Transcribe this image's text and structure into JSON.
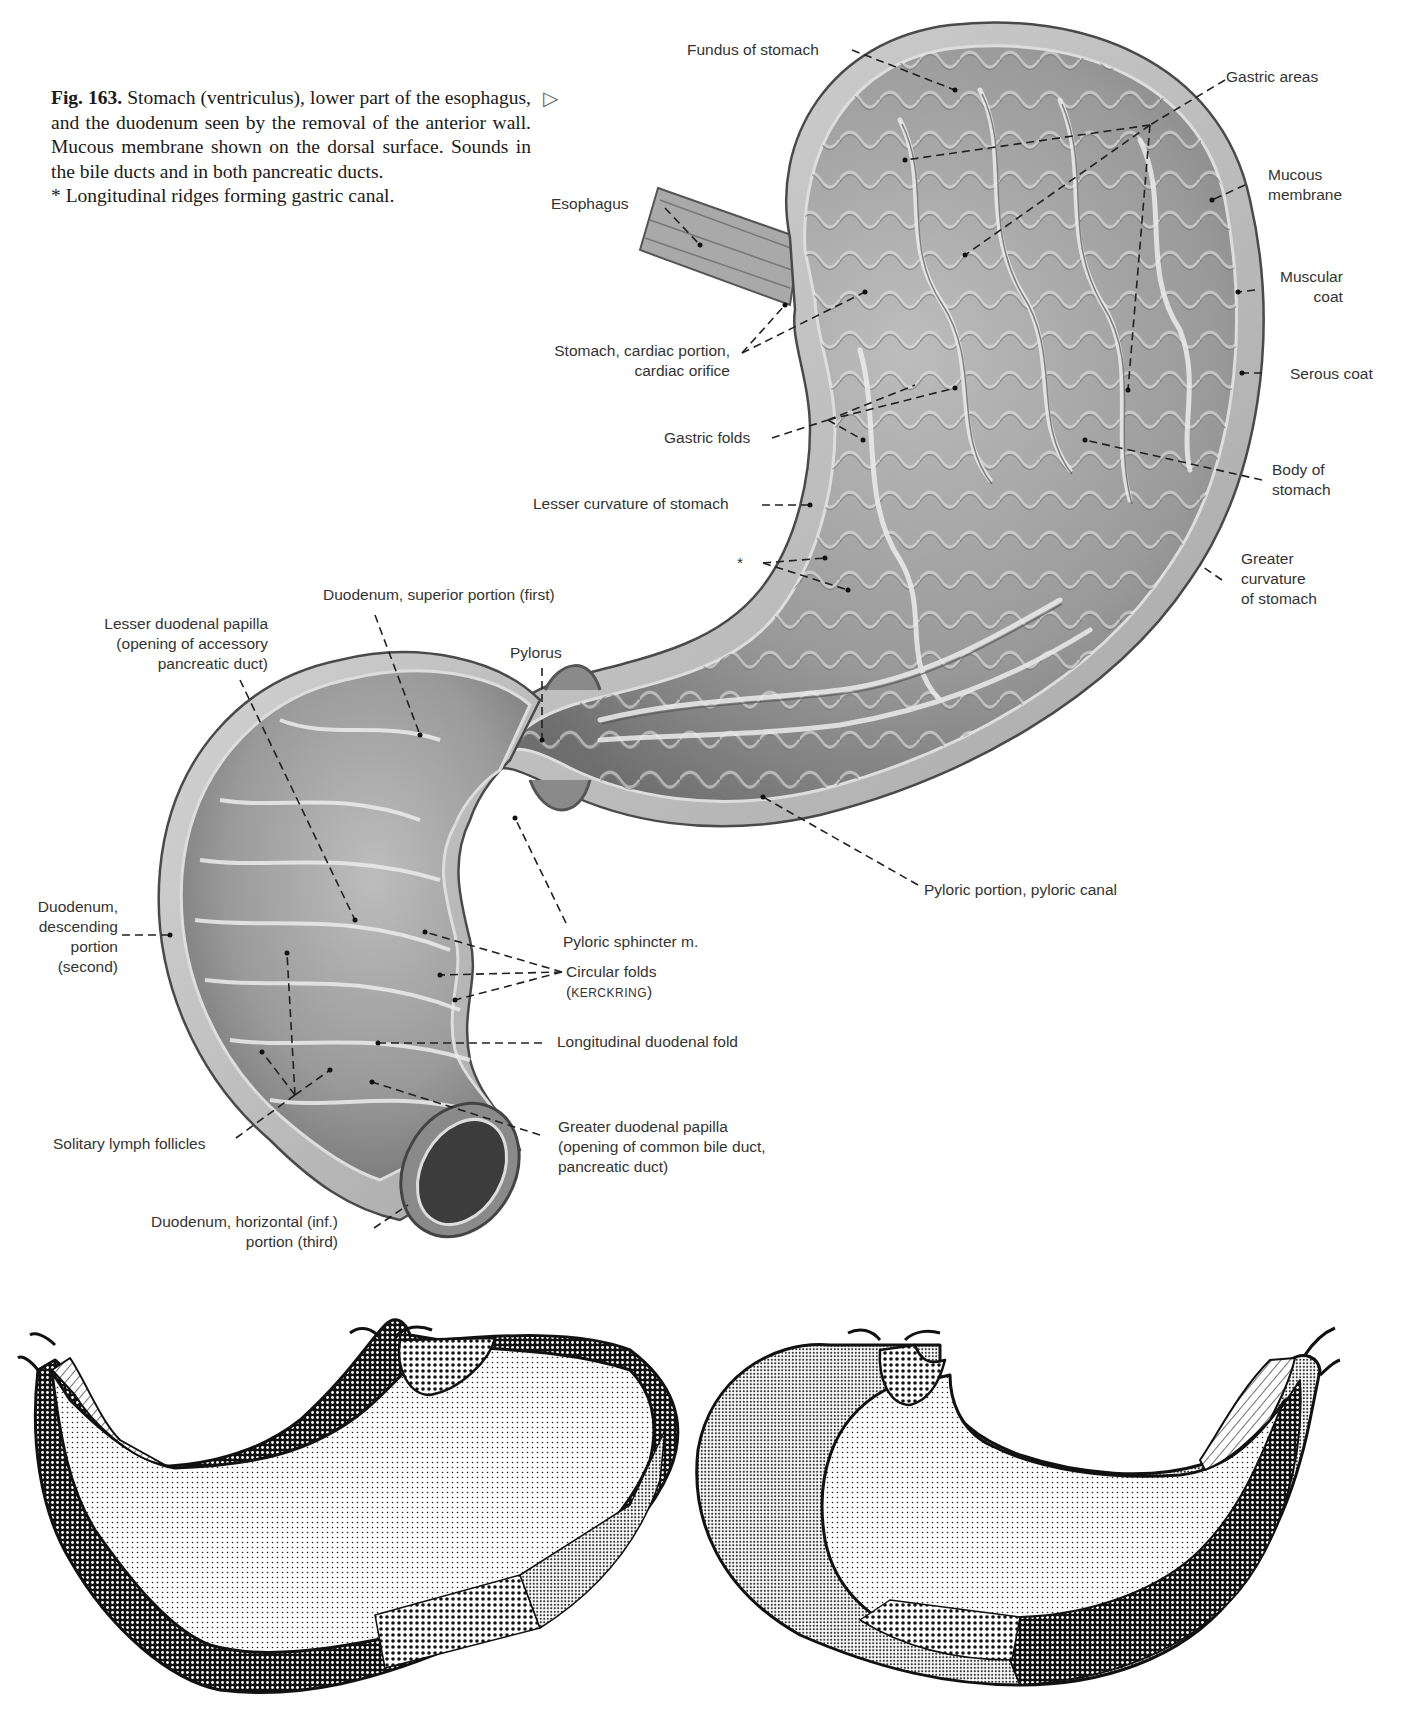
{
  "caption": {
    "figure_number": "Fig. 163.",
    "text": "Stomach (ventriculus), lower part of the esophagus, and the duodenum seen by the removal of the anterior wall. Mucous membrane shown on the dorsal surface. Sounds in the bile ducts and in both pancreatic ducts.",
    "footnote": "* Longitudinal ridges forming gastric canal.",
    "pointer_glyph": "▷"
  },
  "labels": {
    "fundus": "Fundus of stomach",
    "gastric_areas": "Gastric areas",
    "esophagus": "Esophagus",
    "mucous_membrane_1": "Mucous",
    "mucous_membrane_2": "membrane",
    "muscular_coat_1": "Muscular",
    "muscular_coat_2": "coat",
    "serous_coat": "Serous coat",
    "cardiac_1": "Stomach, cardiac portion,",
    "cardiac_2": "cardiac orifice",
    "gastric_folds": "Gastric folds",
    "body_1": "Body of",
    "body_2": "stomach",
    "lesser_curvature": "Lesser curvature of stomach",
    "asterisk": "*",
    "greater_curvature_1": "Greater",
    "greater_curvature_2": "curvature",
    "greater_curvature_3": "of stomach",
    "duodenum_superior": "Duodenum, superior portion (first)",
    "lesser_papilla_1": "Lesser duodenal papilla",
    "lesser_papilla_2": "(opening of accessory",
    "lesser_papilla_3": "pancreatic duct)",
    "pylorus": "Pylorus",
    "pyloric_portion": "Pyloric portion, pyloric canal",
    "duodenum_desc_1": "Duodenum,",
    "duodenum_desc_2": "descending",
    "duodenum_desc_3": "portion",
    "duodenum_desc_4": "(second)",
    "pyloric_sphincter": "Pyloric sphincter m.",
    "circular_folds_1": "Circular folds",
    "circular_folds_2a": "(",
    "circular_folds_2b": "Kerckring",
    "circular_folds_2c": ")",
    "longitudinal_fold": "Longitudinal duodenal fold",
    "solitary_follicles": "Solitary lymph follicles",
    "greater_papilla_1": "Greater duodenal papilla",
    "greater_papilla_2": "(opening of common bile duct,",
    "greater_papilla_3": "pancreatic duct)",
    "duodenum_horiz_1": "Duodenum, horizontal (inf.)",
    "duodenum_horiz_2": "portion (third)"
  },
  "schematics": {
    "left": {
      "regions": [
        "cardiac (hatched)",
        "fundus/body (fine dots)",
        "greater curvature band (coarse grid)",
        "pyloric band (medium grid)",
        "antrum band (fine grid)"
      ]
    },
    "right": {
      "regions": [
        "fundus (fine grid)",
        "cardia (coarse dots)",
        "body (fine dots)",
        "pyloric (hatched)",
        "greater curvature band (coarse grid)",
        "antrum band (medium grid)"
      ]
    }
  },
  "colors": {
    "ink": "#1a1a1a",
    "tissue_dark": "#6e6e6e",
    "tissue_mid": "#9a9a9a",
    "tissue_light": "#c8c8c8",
    "background": "#ffffff"
  }
}
